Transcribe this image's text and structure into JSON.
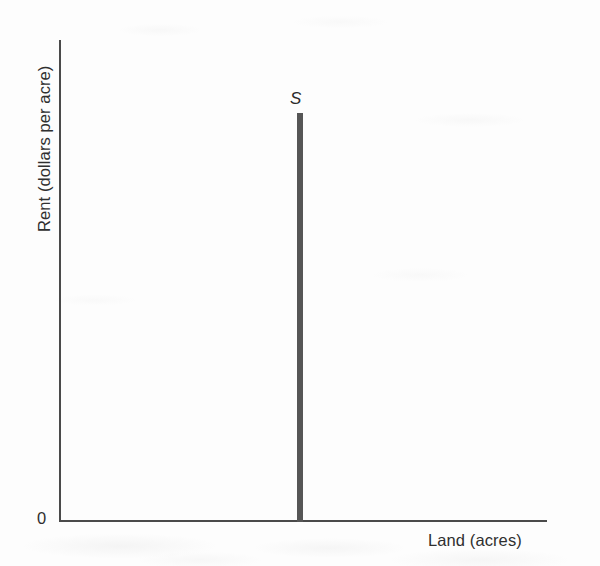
{
  "figure": {
    "background_color": "#ffffff",
    "axis_color": "#4a4a4a",
    "curve_color": "#565656",
    "text_color": "#2f2f2f"
  },
  "axes": {
    "y_label": "Rent (dollars per acre)",
    "x_label": "Land (acres)",
    "origin_label": "0"
  },
  "curves": {
    "supply_label": "S"
  },
  "chart_data": {
    "type": "line",
    "title": "",
    "subtitle": "",
    "xlabel": "Land (acres)",
    "ylabel": "Rent (dollars per acre)",
    "xlim": [
      0,
      100
    ],
    "ylim": [
      0,
      100
    ],
    "grid": false,
    "legend": "none",
    "tick_labels": {
      "x": [],
      "y": [
        "0"
      ]
    },
    "annotations": [
      {
        "text": "S",
        "style": "italic",
        "x": 48.5,
        "y": 86,
        "describes": "vertical (perfectly inelastic) supply curve for land"
      }
    ],
    "series": [
      {
        "name": "S",
        "description": "Perfectly inelastic supply of land: a vertical line at a fixed quantity of acres",
        "shape": "vertical",
        "color": "#565656",
        "x": [
          48.5,
          48.5
        ],
        "y": [
          0,
          84
        ]
      }
    ]
  }
}
